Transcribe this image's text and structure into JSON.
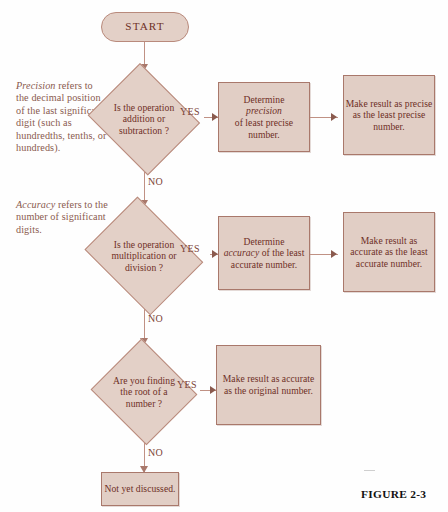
{
  "figure": {
    "caption": "FIGURE 2-3"
  },
  "annotations": [
    {
      "id": "precision-note",
      "emphasis": "Precision",
      "rest": " refers to the decimal position of the last significant digit (such as hundredths, tenths, or hundreds)."
    },
    {
      "id": "accuracy-note",
      "emphasis": "Accuracy",
      "rest": " refers to the number of significant digits."
    }
  ],
  "nodes": {
    "start": {
      "label": "START",
      "shape": "terminator"
    },
    "decision1": {
      "label": "Is the operation addition or subtraction ?",
      "shape": "decision"
    },
    "decision2": {
      "label": "Is the operation multiplication or division ?",
      "shape": "decision"
    },
    "decision3": {
      "label": "Are you finding the root of a number ?",
      "shape": "decision"
    },
    "process1a": {
      "pre": "Determine",
      "emphasis": "precision",
      "post": "of least precise number.",
      "shape": "process"
    },
    "process1b": {
      "label": "Make result as precise as the least precise number.",
      "shape": "process"
    },
    "process2a": {
      "pre": "Determine",
      "emphasis": "accuracy",
      "post": "of the least accurate number.",
      "shape": "process"
    },
    "process2b": {
      "label": "Make result as accurate as the least accurate number.",
      "shape": "process"
    },
    "process3a": {
      "label": "Make result as accurate as the original number.",
      "shape": "process"
    },
    "end": {
      "label": "Not yet discussed.",
      "shape": "process"
    }
  },
  "edges": {
    "yes1": "YES",
    "yes2": "YES",
    "yes3": "YES",
    "no1": "NO",
    "no2": "NO",
    "no3": "NO"
  },
  "colors": {
    "node_fill": "#e3d0c7",
    "process_fill": "#e1cec5",
    "node_border": "#b98a7c",
    "process_border": "#a9786b",
    "node_text": "#6e2f26",
    "annotation_text": "#8a5a4e",
    "connector": "#c09184",
    "caption_text": "#111111",
    "background": "#fefefe"
  }
}
